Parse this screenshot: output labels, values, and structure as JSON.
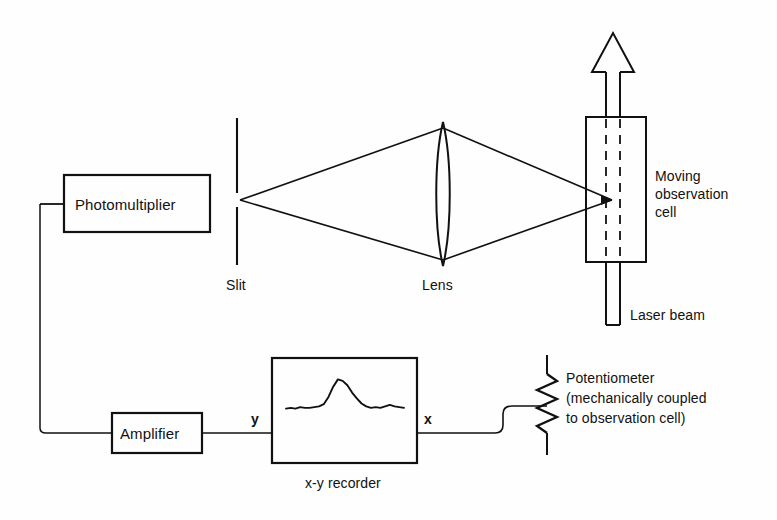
{
  "figure": {
    "type": "schematic-diagram",
    "background_color": "#fefefe",
    "line_color": "#111111"
  },
  "components": {
    "photomultiplier": {
      "label": "Photomultiplier",
      "shape": "rectangle",
      "x": 64,
      "y": 175,
      "w": 146,
      "h": 57
    },
    "amplifier": {
      "label": "Amplifier",
      "shape": "rectangle",
      "x": 112,
      "y": 413,
      "w": 90,
      "h": 40
    },
    "recorder": {
      "label": "x-y recorder",
      "shape": "rectangle",
      "x": 272,
      "y": 358,
      "w": 145,
      "h": 105,
      "input_y_label": "y",
      "input_x_label": "x",
      "trace_name": "scattering-peak-trace"
    },
    "slit": {
      "label": "Slit",
      "shape": "vertical-line",
      "x": 237,
      "y_top": 118,
      "y_bottom": 265
    },
    "lens": {
      "label": "Lens",
      "shape": "biconvex-lens",
      "x": 443,
      "y_top": 122,
      "y_bottom": 266
    },
    "cell": {
      "label": "Moving\nobservation\ncell",
      "label_line_1": "Moving",
      "label_line_2": "observation",
      "label_line_3": "cell",
      "shape": "rectangle",
      "x": 586,
      "y": 117,
      "w": 60,
      "h": 145
    },
    "laser_beam": {
      "label": "Laser beam",
      "shape": "beam-channel",
      "direction": "upward"
    },
    "potentiometer": {
      "label_line_1": "Potentiometer",
      "label_line_2": "(mechanically coupled",
      "label_line_3": "to observation cell)",
      "shape": "zigzag-resistor",
      "x": 547,
      "y_top": 355,
      "y_bottom": 455
    }
  },
  "labels": {
    "photomultiplier": "Photomultiplier",
    "amplifier": "Amplifier",
    "recorder": "x-y recorder",
    "slit": "Slit",
    "lens": "Lens",
    "cell_1": "Moving",
    "cell_2": "observation",
    "cell_3": "cell",
    "laser": "Laser beam",
    "pot_1": "Potentiometer",
    "pot_2": "(mechanically coupled",
    "pot_3": "to observation cell)",
    "axis_y": "y",
    "axis_x": "x"
  },
  "chart_data": {
    "type": "line",
    "xlabel": "x",
    "ylabel": "y",
    "x": [
      0,
      4,
      8,
      12,
      16,
      20,
      24,
      28,
      32,
      36,
      40,
      44,
      48,
      52,
      56,
      60,
      64,
      68,
      72,
      76,
      80,
      84,
      88,
      92,
      96,
      100
    ],
    "values": [
      6,
      7,
      6,
      8,
      7,
      7,
      8,
      9,
      12,
      22,
      36,
      46,
      44,
      38,
      28,
      20,
      13,
      9,
      7,
      8,
      7,
      9,
      11,
      9,
      8,
      7
    ],
    "ylim": [
      0,
      52
    ],
    "grid": false,
    "legend": null
  }
}
